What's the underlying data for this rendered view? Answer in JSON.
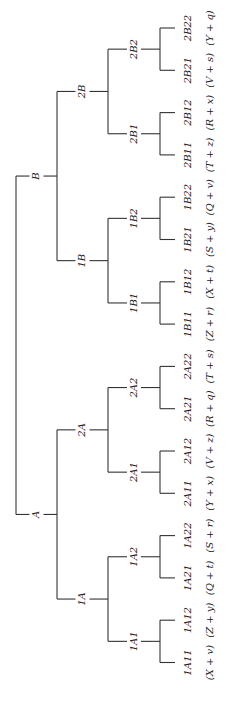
{
  "diagram": {
    "type": "tree",
    "orientation": "rotated-90",
    "root": {
      "children": [
        {
          "label": "B",
          "children": [
            {
              "label": "2B",
              "children": [
                {
                  "label": "2B2",
                  "children": [
                    {
                      "label": "2B22",
                      "expr": "(Y + q)"
                    },
                    {
                      "label": "2B21",
                      "expr": "(V + s)"
                    }
                  ]
                },
                {
                  "label": "2B1",
                  "children": [
                    {
                      "label": "2B12",
                      "expr": "(R + x)"
                    },
                    {
                      "label": "2B11",
                      "expr": "(T + z)"
                    }
                  ]
                }
              ]
            },
            {
              "label": "1B",
              "children": [
                {
                  "label": "1B2",
                  "children": [
                    {
                      "label": "1B22",
                      "expr": "(Q + v)"
                    },
                    {
                      "label": "1B21",
                      "expr": "(S + y)"
                    }
                  ]
                },
                {
                  "label": "1B1",
                  "children": [
                    {
                      "label": "1B12",
                      "expr": "(X + t)"
                    },
                    {
                      "label": "1B11",
                      "expr": "(Z + r)"
                    }
                  ]
                }
              ]
            }
          ]
        },
        {
          "label": "A",
          "children": [
            {
              "label": "2A",
              "children": [
                {
                  "label": "2A2",
                  "children": [
                    {
                      "label": "2A22",
                      "expr": "(T + s)"
                    },
                    {
                      "label": "2A21",
                      "expr": "(R + q)"
                    }
                  ]
                },
                {
                  "label": "2A1",
                  "children": [
                    {
                      "label": "2A12",
                      "expr": "(V + z)"
                    },
                    {
                      "label": "2A11",
                      "expr": "(Y + x)"
                    }
                  ]
                }
              ]
            },
            {
              "label": "1A",
              "children": [
                {
                  "label": "1A2",
                  "children": [
                    {
                      "label": "1A22",
                      "expr": "(S + r)"
                    },
                    {
                      "label": "1A21",
                      "expr": "(Q + t)"
                    }
                  ]
                },
                {
                  "label": "1A1",
                  "children": [
                    {
                      "label": "1A12",
                      "expr": "(Z + y)"
                    },
                    {
                      "label": "1A11",
                      "expr": "(X + v)"
                    }
                  ]
                }
              ]
            }
          ]
        }
      ]
    }
  }
}
